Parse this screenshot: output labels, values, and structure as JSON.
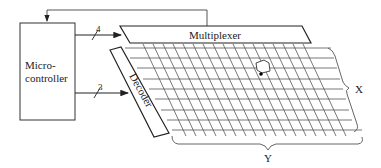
{
  "microcontroller": {
    "line1": "Micro-",
    "line2": "controller"
  },
  "multiplexer": {
    "label": "Multiplexer"
  },
  "decoder": {
    "label": "Decoder"
  },
  "buses": [
    {
      "name": "to-multiplexer",
      "width_label": "4"
    },
    {
      "name": "to-decoder",
      "width_label": "3"
    }
  ],
  "grid": {
    "horizontal_lines": 8,
    "diagonal_lines": 17
  },
  "dimensions": {
    "x_label": "X",
    "y_label": "Y"
  },
  "colors": {
    "line": "#222222",
    "grid": "#555555",
    "background": "#ffffff"
  }
}
